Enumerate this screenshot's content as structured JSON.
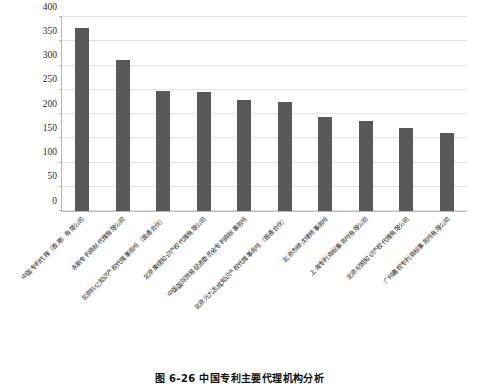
{
  "chart_data": {
    "type": "bar",
    "title": "",
    "xlabel": "",
    "ylabel": "",
    "ylim": [
      0,
      400
    ],
    "yticks": [
      0,
      50,
      100,
      150,
      200,
      250,
      300,
      350,
      400
    ],
    "grid": true,
    "legend": false,
    "bar_color": "#595959",
    "gridline_color": "#e2e2e2",
    "axis_color": "#b9b9b9",
    "categories": [
      "中国专利代理（香港）有限公司",
      "永新专利商标代理有限公司",
      "北京科亿知识产权代理事务所（普通合伙）",
      "北京集佳知识产权代理有限公司",
      "中国国际贸易促进委员会专利商标事务所",
      "北京元九志成知识产权代理事务所（普通合伙）",
      "北京市柳沈律师事务所",
      "上海专利商标事务所有限公司",
      "北京纪凯知识产权代理有限公司",
      "广州嘉权专利商标事务所有限公司"
    ],
    "values": [
      378,
      312,
      248,
      245,
      228,
      225,
      193,
      185,
      171,
      161
    ]
  },
  "caption": {
    "text": "图 6-26  中国专利主要代理机构分析"
  }
}
